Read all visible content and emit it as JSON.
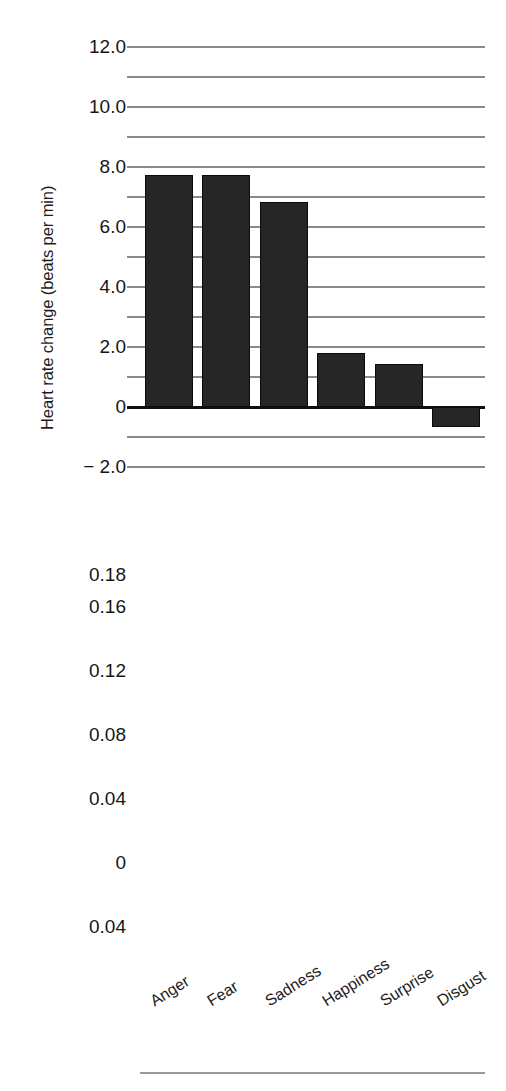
{
  "chart_data": [
    {
      "type": "bar",
      "title": "",
      "xlabel": "",
      "ylabel": "Heart rate change (beats per min)",
      "categories": [
        "Anger",
        "Fear",
        "Sadness",
        "Happiness",
        "Surprise",
        "Disgust"
      ],
      "values": [
        7.75,
        7.75,
        6.85,
        1.8,
        1.45,
        -0.65
      ],
      "ylim": [
        -2.0,
        12.5
      ],
      "ytick_values": [
        12.0,
        11.0,
        10.0,
        9.0,
        8.0,
        7.0,
        6.0,
        5.0,
        4.0,
        3.0,
        2.0,
        1.0,
        0,
        -1.0,
        -2.0
      ],
      "ytick_labels": [
        "12.0",
        "",
        "10.0",
        "",
        "8.0",
        "",
        "6.0",
        "",
        "4.0",
        "",
        "2.0",
        "",
        "0",
        "",
        "− 2.0"
      ],
      "grid": true,
      "legend": "none",
      "bar_color": "#262626"
    },
    {
      "type": "bar",
      "title": "",
      "xlabel": "",
      "ylabel": "Temperature change (degrees centigrade)",
      "categories": [
        "Anger",
        "Fear",
        "Sadness",
        "Happiness",
        "Surprise",
        "Disgust"
      ],
      "values": [
        0.1455,
        -0.012,
        0.009,
        0.03,
        -0.005,
        -0.03
      ],
      "ylim": [
        -0.04,
        0.18
      ],
      "ytick_values": [
        0.18,
        0.17,
        0.16,
        0.14,
        0.12,
        0.1,
        0.08,
        0.06,
        0.04,
        0.02,
        0,
        -0.02,
        -0.04
      ],
      "ytick_labels": [
        "0.18",
        "",
        "0.16",
        "",
        "0.12",
        "",
        "0.08",
        "",
        "0.04",
        "",
        "0",
        "",
        "0.04"
      ],
      "grid": true,
      "legend": "none",
      "bar_color": "#262626"
    }
  ],
  "hr_chart": {
    "axis_title": "Heart rate change (beats per min)",
    "ticks": [
      {
        "label": "12.0",
        "value": 12.0
      },
      {
        "label": "",
        "value": 11.0
      },
      {
        "label": "10.0",
        "value": 10.0
      },
      {
        "label": "",
        "value": 9.0
      },
      {
        "label": "8.0",
        "value": 8.0
      },
      {
        "label": "",
        "value": 7.0
      },
      {
        "label": "6.0",
        "value": 6.0
      },
      {
        "label": "",
        "value": 5.0
      },
      {
        "label": "4.0",
        "value": 4.0
      },
      {
        "label": "",
        "value": 3.0
      },
      {
        "label": "2.0",
        "value": 2.0
      },
      {
        "label": "",
        "value": 1.0
      },
      {
        "label": "0",
        "value": 0
      },
      {
        "label": "",
        "value": -1.0
      },
      {
        "label": "− 2.0",
        "value": -2.0
      }
    ],
    "bars": [
      {
        "category": "Anger",
        "value": 7.75
      },
      {
        "category": "Fear",
        "value": 7.75
      },
      {
        "category": "Sadness",
        "value": 6.85
      },
      {
        "category": "Happiness",
        "value": 1.8
      },
      {
        "category": "Surprise",
        "value": 1.45
      },
      {
        "category": "Disgust",
        "value": -0.65
      }
    ]
  },
  "temp_chart": {
    "axis_title": "Temperature change (degrees centigrade)",
    "ticks": [
      {
        "label": "0.18",
        "value": 0.18
      },
      {
        "label": "",
        "value": 0.17
      },
      {
        "label": "0.16",
        "value": 0.16
      },
      {
        "label": "",
        "value": 0.14
      },
      {
        "label": "0.12",
        "value": 0.12
      },
      {
        "label": "",
        "value": 0.1
      },
      {
        "label": "0.08",
        "value": 0.08
      },
      {
        "label": "",
        "value": 0.06
      },
      {
        "label": "0.04",
        "value": 0.04
      },
      {
        "label": "",
        "value": 0.02
      },
      {
        "label": "0",
        "value": 0
      },
      {
        "label": "",
        "value": -0.02
      },
      {
        "label": "0.04",
        "value": -0.04
      }
    ],
    "bars": [
      {
        "category": "Anger",
        "value": 0.1455
      },
      {
        "category": "Fear",
        "value": -0.012
      },
      {
        "category": "Sadness",
        "value": 0.009
      },
      {
        "category": "Happiness",
        "value": 0.03
      },
      {
        "category": "Surprise",
        "value": -0.005
      },
      {
        "category": "Disgust",
        "value": -0.03
      }
    ]
  },
  "categories": [
    "Anger",
    "Fear",
    "Sadness",
    "Happiness",
    "Surprise",
    "Disgust"
  ],
  "colors": {
    "bar": "#262626",
    "bar_edge": "#0a0a0a",
    "grid": "#8a8a8a",
    "zero": "#101010",
    "text": "#1a1a1a",
    "background": "#ffffff"
  }
}
